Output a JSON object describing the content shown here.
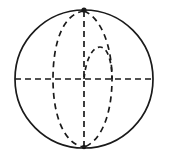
{
  "figure": {
    "background_color": "#ffffff",
    "stroke_color": "#1a1a1a",
    "width": 169,
    "height": 165
  },
  "geometry": {
    "center_x": 84,
    "center_y": 79,
    "radius_x": 69,
    "radius_y": 69,
    "north_pole_x": 84,
    "north_pole_y": 10,
    "south_pole_x": 84,
    "south_pole_y": 148,
    "left_point_x": 15,
    "right_point_x": 153,
    "equator_y": 79
  },
  "elements": {
    "outline_label": "sphere-outline",
    "equator_label": "equator-dashed-line",
    "polar_axis_label": "polar-axis-dashed-line",
    "meridian_left_label": "meridian-ellipse-left",
    "meridian_right_label": "meridian-ellipse-right",
    "inner_arc_label": "inner-arc-upper-right",
    "north_pole_label": "north-pole-point",
    "south_pole_label": "south-pole-point"
  },
  "paths": {
    "equator": "M 15 79 L 153 79",
    "polar_axis": "M 84 11 L 84 147",
    "meridian_left": "M 84 11 C 63 14 53 42 53 79 C 53 116 64 144 84 147",
    "meridian_right": "M 84 11 C 100 17 112 44 112 79 C 112 116 100 142 84 147",
    "inner_arc": "M 84 79 C 86 58 93 47 100 47 C 107 47 112 60 112 79",
    "sphere_circle": "M 15 79 A 69 69 0 1 1 153 79 A 69 69 0 1 1 15 79"
  }
}
